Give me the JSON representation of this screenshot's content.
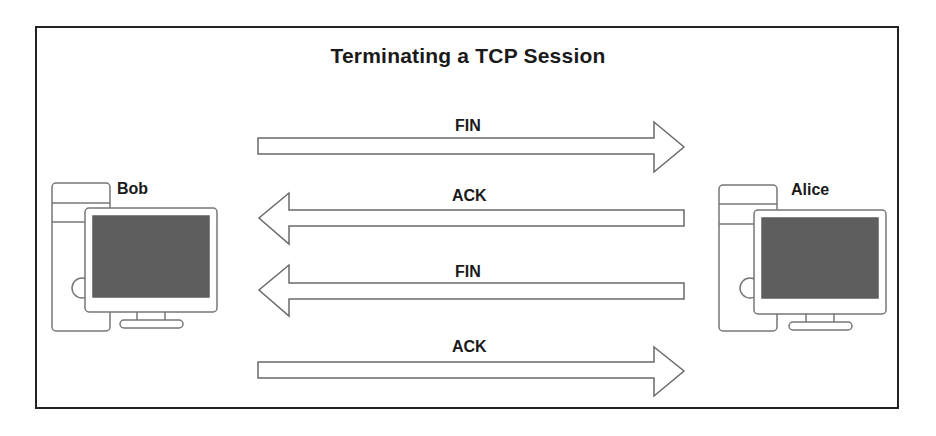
{
  "title": "Terminating a TCP Session",
  "hosts": {
    "left": {
      "name": "Bob",
      "icon": "desktop-computer-icon"
    },
    "right": {
      "name": "Alice",
      "icon": "desktop-computer-icon"
    }
  },
  "messages": [
    {
      "label": "FIN",
      "direction": "Bob -> Alice"
    },
    {
      "label": "ACK",
      "direction": "Alice -> Bob"
    },
    {
      "label": "FIN",
      "direction": "Alice -> Bob"
    },
    {
      "label": "ACK",
      "direction": "Bob -> Alice"
    }
  ],
  "colors": {
    "frame": "#222222",
    "outline": "#6a6a6a",
    "screen": "#5c5c5c",
    "text": "#1a1a1a"
  }
}
